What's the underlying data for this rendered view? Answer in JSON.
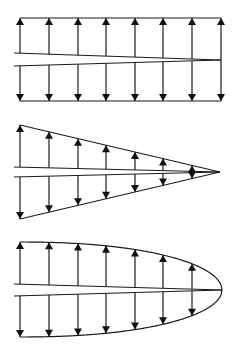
{
  "canvas": {
    "width": 239,
    "height": 360,
    "background": "#ffffff",
    "stroke": "#1a1a1a"
  },
  "arrow_x": [
    20,
    49,
    78,
    106,
    135,
    163,
    192,
    221
  ],
  "diagrams": [
    {
      "name": "uniform-distribution",
      "shape": "rectangle",
      "left_x": 20,
      "right_x": 221,
      "top_y": 18,
      "bottom_y": 101,
      "crack": {
        "left_x": 14,
        "upper_y": 53,
        "lower_y": 66,
        "tip_x": 221,
        "tip_y": 60
      }
    },
    {
      "name": "linear-distribution",
      "shape": "triangle",
      "left_x": 20,
      "tip_x": 220,
      "top_y": 125,
      "bottom_y": 219,
      "center_y": 172,
      "crack": {
        "left_x": 14,
        "upper_y": 167,
        "lower_y": 177,
        "tip_x": 220,
        "tip_y": 172
      }
    },
    {
      "name": "parabolic-distribution",
      "shape": "parabola",
      "left_x": 20,
      "tip_x": 222,
      "top_y": 242,
      "bottom_y": 337,
      "center_y": 290,
      "crack": {
        "left_x": 14,
        "upper_y": 284,
        "lower_y": 296,
        "tip_x": 222,
        "tip_y": 290
      }
    }
  ]
}
